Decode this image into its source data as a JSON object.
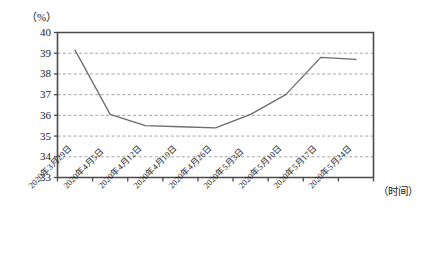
{
  "chart_data": {
    "type": "line",
    "title": "",
    "xlabel": "（时间）",
    "ylabel": "（%）",
    "ylim": [
      33,
      40
    ],
    "yticks": [
      33,
      34,
      35,
      36,
      37,
      38,
      39,
      40
    ],
    "grid": true,
    "legend": "none",
    "line_color": "#6b6b6b",
    "axis_color": "#4a4a4a",
    "grid_color": "#9a9a9a",
    "categories": [
      "2020年3月29日",
      "2020年4月5日",
      "2020年4月12日",
      "2020年4月19日",
      "2020年4月26日",
      "2020年5月3日",
      "2020年5月10日",
      "2020年5月17日",
      "2020年5月24日"
    ],
    "values": [
      39.15,
      36.05,
      35.5,
      35.45,
      35.4,
      36.05,
      37.0,
      38.8,
      38.7
    ],
    "series": [
      {
        "name": "",
        "values": [
          39.15,
          36.05,
          35.5,
          35.45,
          35.4,
          36.05,
          37.0,
          38.8,
          38.7
        ]
      }
    ]
  }
}
